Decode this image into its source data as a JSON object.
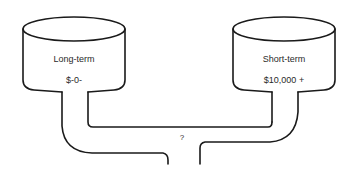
{
  "diagram": {
    "tanks": [
      {
        "name": "Long-term",
        "value": "$-0-"
      },
      {
        "name": "Short-term",
        "value": "$10,000 +"
      }
    ],
    "junction_label": "?",
    "stroke_color": "#1a1a1a"
  }
}
